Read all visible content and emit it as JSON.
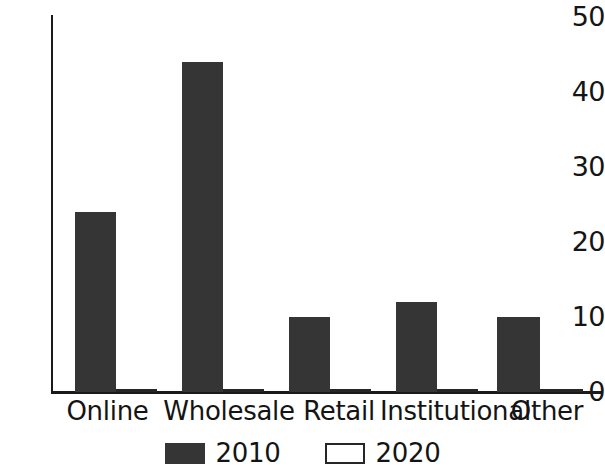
{
  "chart_data": {
    "type": "bar",
    "title": "",
    "subtitle": "",
    "xlabel": "",
    "ylabel": "",
    "categories": [
      "Online",
      "Wholesale",
      "Retail",
      "Institutional",
      "Other"
    ],
    "series": [
      {
        "name": "2010",
        "values": [
          24,
          44,
          10,
          12,
          10
        ],
        "color": "#353535"
      },
      {
        "name": "2020",
        "values": [
          0,
          0,
          0,
          0,
          0
        ],
        "color": "#ffffff"
      }
    ],
    "ylim": [
      0,
      50
    ],
    "yticks": [
      0,
      10,
      20,
      30,
      40,
      50
    ],
    "ytick_labels": [
      "0",
      "10",
      "20",
      "30",
      "40",
      "50"
    ],
    "grid": false,
    "legend_position": "bottom",
    "legend_entries": [
      "2010",
      "2020"
    ],
    "annotations": []
  },
  "axis": {
    "y_labels": [
      "50",
      "40",
      "30",
      "20",
      "10",
      "0"
    ]
  },
  "legend": {
    "items": [
      {
        "label": "2010",
        "style": "filled"
      },
      {
        "label": "2020",
        "style": "open"
      }
    ]
  }
}
